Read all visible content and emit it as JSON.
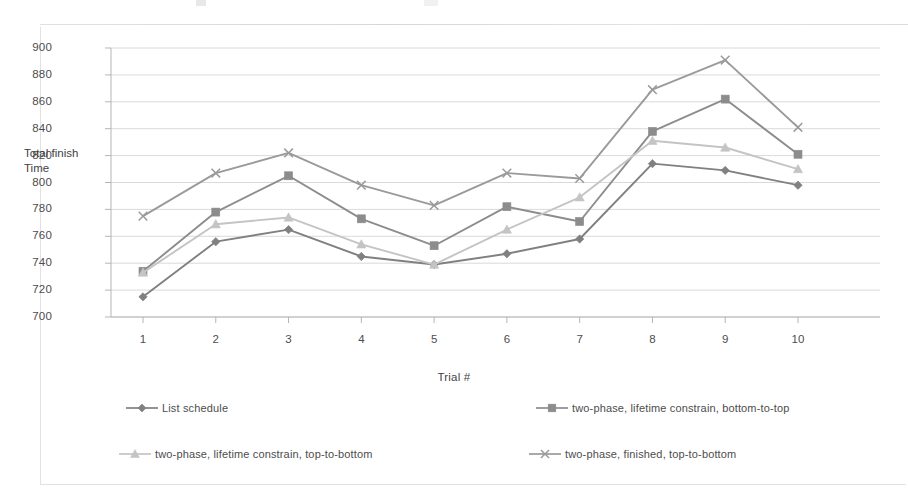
{
  "chart_data": {
    "type": "line",
    "title": "",
    "xlabel": "Trial #",
    "ylabel": "Total finish Time",
    "categories": [
      "1",
      "2",
      "3",
      "4",
      "5",
      "6",
      "7",
      "8",
      "9",
      "10"
    ],
    "x": [
      1,
      2,
      3,
      4,
      5,
      6,
      7,
      8,
      9,
      10
    ],
    "ylim": [
      700,
      900
    ],
    "ytick_step": 20,
    "yticks": [
      "900",
      "880",
      "860",
      "840",
      "820",
      "800",
      "780",
      "760",
      "740",
      "720",
      "700"
    ],
    "grid": "horizontal",
    "legend_position": "bottom",
    "series": [
      {
        "name": "List schedule",
        "marker": "diamond",
        "color": "#808080",
        "values": [
          715,
          756,
          765,
          745,
          739,
          747,
          758,
          814,
          809,
          798
        ]
      },
      {
        "name": "two-phase, lifetime constrain, bottom-to-top",
        "marker": "square",
        "color": "#8c8c8c",
        "values": [
          734,
          778,
          805,
          773,
          753,
          782,
          771,
          838,
          862,
          821
        ]
      },
      {
        "name": "two-phase, lifetime constrain, top-to-bottom",
        "marker": "triangle",
        "color": "#c4c4c4",
        "values": [
          733,
          769,
          774,
          754,
          739,
          765,
          789,
          831,
          826,
          810
        ]
      },
      {
        "name": "two-phase, finished, top-to-bottom",
        "marker": "cross",
        "color": "#9a9a9a",
        "values": [
          775,
          807,
          822,
          798,
          783,
          807,
          803,
          869,
          891,
          841
        ]
      }
    ]
  },
  "axis": {
    "y_label_line1": "Total finish",
    "y_label_line2": "Time",
    "x_label": "Trial #"
  },
  "colors": {
    "grid": "#d0d0d0",
    "axis": "#b5b5b5",
    "frame": "#e2e2e2",
    "text": "#4d4d4d",
    "background": "#ffffff"
  }
}
